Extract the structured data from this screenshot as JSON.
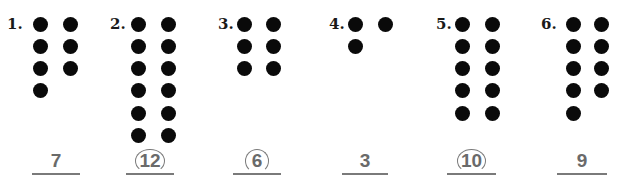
{
  "problems": [
    {
      "label": "1.",
      "dots": 7,
      "answer": "7",
      "circled": false
    },
    {
      "label": "2.",
      "dots": 12,
      "answer": "12",
      "circled": true
    },
    {
      "label": "3.",
      "dots": 6,
      "answer": "6",
      "circled": true
    },
    {
      "label": "4.",
      "dots": 3,
      "answer": "3",
      "circled": false
    },
    {
      "label": "5.",
      "dots": 10,
      "answer": "10",
      "circled": true
    },
    {
      "label": "6.",
      "dots": 9,
      "answer": "9",
      "circled": false
    }
  ],
  "colors": {
    "dot": "#0a0a0a",
    "answer": "#6a6a6a",
    "line": "#7a7a7a"
  }
}
